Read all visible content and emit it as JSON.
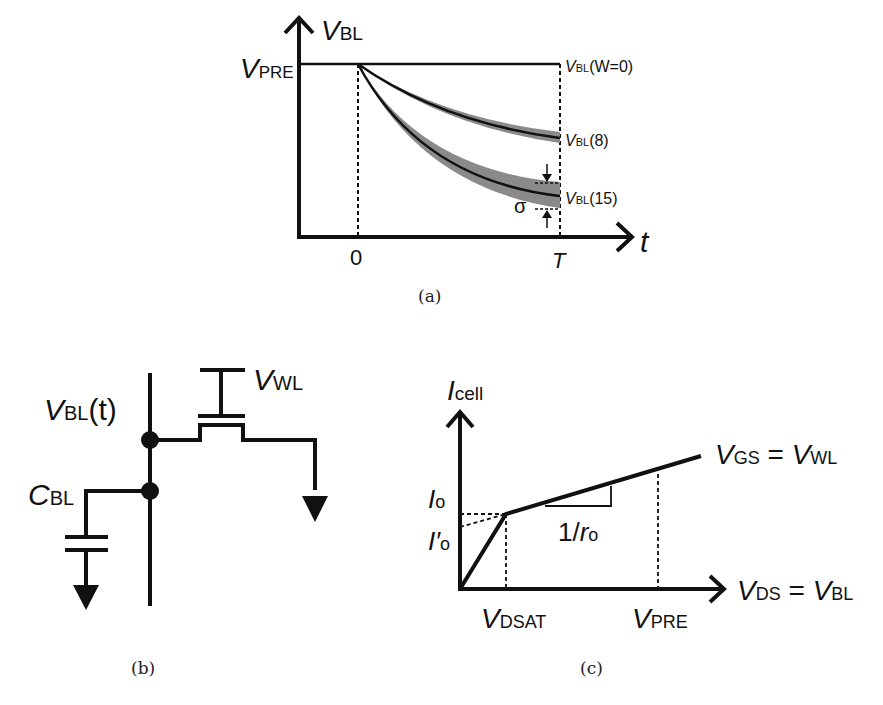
{
  "panel_a": {
    "caption": "(a)",
    "y_axis": {
      "main": "V",
      "sub": "BL"
    },
    "x_axis": "t",
    "y_tick": {
      "main": "V",
      "sub": "PRE"
    },
    "x_ticks": [
      "0",
      "T"
    ],
    "curves": [
      {
        "main": "V",
        "sub": "BL",
        "suffix": "(W=0)"
      },
      {
        "main": "V",
        "sub": "BL",
        "suffix": "(8)"
      },
      {
        "main": "V",
        "sub": "BL",
        "suffix": "(15)"
      }
    ],
    "sigma": "σ"
  },
  "panel_b": {
    "caption": "(b)",
    "bitline": {
      "main": "V",
      "sub": "BL",
      "suffix": "(t)"
    },
    "wordline": {
      "main": "V",
      "sub": "WL"
    },
    "capacitor": {
      "main": "C",
      "sub": "BL"
    }
  },
  "panel_c": {
    "caption": "(c)",
    "y_axis": {
      "main": "I",
      "sub": "cell"
    },
    "x_axis": {
      "main1": "V",
      "sub1": "DS",
      "eq": " = ",
      "main2": "V",
      "sub2": "BL"
    },
    "curve_label": {
      "main1": "V",
      "sub1": "GS",
      "eq": " = ",
      "main2": "V",
      "sub2": "WL"
    },
    "i0": {
      "main": "I",
      "sub": "o"
    },
    "i0p": {
      "main": "I′",
      "sub": "o"
    },
    "slope": {
      "pre": "1/",
      "main": "r",
      "sub": "o"
    },
    "x_ticks": [
      {
        "main": "V",
        "sub": "DSAT"
      },
      {
        "main": "V",
        "sub": "PRE"
      }
    ]
  }
}
